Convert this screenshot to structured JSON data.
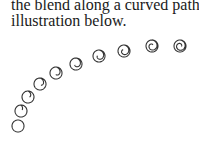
{
  "paragraph": {
    "line1": "the blend along a curved path, as in the",
    "line2": "illustration below."
  },
  "illustration": {
    "description": "Blend of circles transitioning into spirals along a curved path",
    "stroke_color": "#333333",
    "steps": [
      {
        "x": 18,
        "y": 126,
        "r": 6,
        "spiral": 0
      },
      {
        "x": 21,
        "y": 111,
        "r": 6,
        "spiral": 0.1
      },
      {
        "x": 28,
        "y": 97,
        "r": 6,
        "spiral": 0.2
      },
      {
        "x": 40,
        "y": 84,
        "r": 6,
        "spiral": 0.3
      },
      {
        "x": 56,
        "y": 73,
        "r": 6,
        "spiral": 0.4
      },
      {
        "x": 76,
        "y": 64,
        "r": 6,
        "spiral": 0.5
      },
      {
        "x": 99,
        "y": 56,
        "r": 6,
        "spiral": 0.6
      },
      {
        "x": 124,
        "y": 51,
        "r": 6,
        "spiral": 0.7
      },
      {
        "x": 152,
        "y": 46,
        "r": 6,
        "spiral": 0.85
      },
      {
        "x": 180,
        "y": 46,
        "r": 6,
        "spiral": 1.0
      }
    ]
  }
}
